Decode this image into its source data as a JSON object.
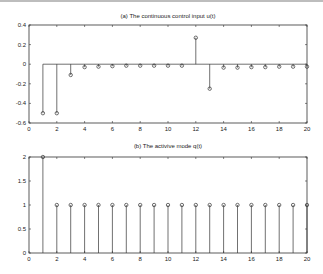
{
  "chart_data": [
    {
      "type": "stem",
      "title": "(a) The continuous control input u(t)",
      "xlabel": "",
      "ylabel": "",
      "xlim": [
        0,
        20
      ],
      "ylim": [
        -0.6,
        0.4
      ],
      "xticks": [
        0,
        2,
        4,
        6,
        8,
        10,
        12,
        14,
        16,
        18,
        20
      ],
      "yticks": [
        -0.6,
        -0.4,
        -0.2,
        0,
        0.2,
        0.4
      ],
      "ytick_labels": [
        "-0.6",
        "-0.4",
        "-0.2",
        "0",
        "0.2",
        "0.4"
      ],
      "grid": false,
      "x": [
        1,
        2,
        3,
        4,
        5,
        6,
        7,
        8,
        9,
        10,
        11,
        12,
        13,
        14,
        15,
        16,
        17,
        18,
        19,
        20
      ],
      "values": [
        -0.5,
        -0.5,
        -0.11,
        -0.03,
        -0.025,
        -0.02,
        -0.015,
        -0.015,
        -0.015,
        -0.015,
        -0.015,
        0.27,
        -0.25,
        -0.035,
        -0.035,
        -0.03,
        -0.03,
        -0.025,
        -0.025,
        -0.025
      ]
    },
    {
      "type": "stem",
      "title": "(b) The activive mode q(t)",
      "xlabel": "",
      "ylabel": "",
      "xlim": [
        0,
        20
      ],
      "ylim": [
        0,
        2
      ],
      "xticks": [
        0,
        2,
        4,
        6,
        8,
        10,
        12,
        14,
        16,
        18,
        20
      ],
      "yticks": [
        0,
        0.5,
        1,
        1.5,
        2
      ],
      "ytick_labels": [
        "0",
        "0.5",
        "1",
        "1.5",
        "2"
      ],
      "grid": false,
      "x": [
        1,
        2,
        3,
        4,
        5,
        6,
        7,
        8,
        9,
        10,
        11,
        12,
        13,
        14,
        15,
        16,
        17,
        18,
        19,
        20
      ],
      "values": [
        2,
        1,
        1,
        1,
        1,
        1,
        1,
        1,
        1,
        1,
        1,
        1,
        1,
        1,
        1,
        1,
        1,
        1,
        1,
        1
      ]
    }
  ]
}
